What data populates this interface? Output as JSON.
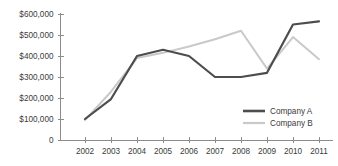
{
  "chart_data": {
    "type": "line",
    "title": "",
    "xlabel": "",
    "ylabel": "",
    "grid": false,
    "legend_position": "right-inside",
    "categories": [
      "2002",
      "2003",
      "2004",
      "2005",
      "2006",
      "2007",
      "2008",
      "2009",
      "2010",
      "2011"
    ],
    "ylim": [
      0,
      600000
    ],
    "ytick_values": [
      0,
      100000,
      200000,
      300000,
      400000,
      500000,
      600000
    ],
    "ytick_labels": [
      "0",
      "$100,000",
      "$200,000",
      "$300,000",
      "$400,000",
      "$500,000",
      "$600,000"
    ],
    "series": [
      {
        "name": "Company A",
        "color": "#4d4d4d",
        "values": [
          100000,
          195000,
          400000,
          430000,
          400000,
          300000,
          300000,
          320000,
          550000,
          565000
        ]
      },
      {
        "name": "Company B",
        "color": "#c9c9c9",
        "values": [
          95000,
          230000,
          390000,
          415000,
          445000,
          480000,
          520000,
          340000,
          490000,
          385000
        ]
      }
    ]
  },
  "legend": {
    "entries": [
      {
        "label": "Company A"
      },
      {
        "label": "Company B"
      }
    ]
  },
  "colors": {
    "series_a": "#4d4d4d",
    "series_b": "#c9c9c9",
    "axis": "#8d8d8d",
    "text": "#3b3b3b",
    "background": "#ffffff"
  }
}
